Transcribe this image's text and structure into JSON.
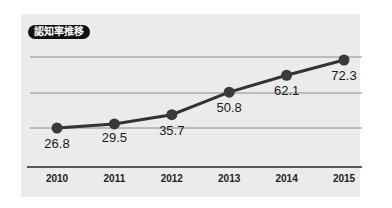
{
  "title": "認知率推移",
  "colors": {
    "background": "#ebebeb",
    "line": "#333333",
    "marker": "#3a3a3a",
    "grid": "#888888",
    "axis": "#222222",
    "badge": "#111111"
  },
  "chart_data": {
    "type": "line",
    "title": "認知率推移",
    "xlabel": "",
    "ylabel": "",
    "categories": [
      "2010",
      "2011",
      "2012",
      "2013",
      "2014",
      "2015"
    ],
    "series": [
      {
        "name": "認知率",
        "values": [
          26.8,
          29.5,
          35.7,
          50.8,
          62.1,
          72.3
        ]
      }
    ],
    "data_labels": [
      "26.8",
      "29.5",
      "35.7",
      "50.8",
      "62.1",
      "72.3"
    ],
    "grid": true,
    "legend": "none"
  }
}
